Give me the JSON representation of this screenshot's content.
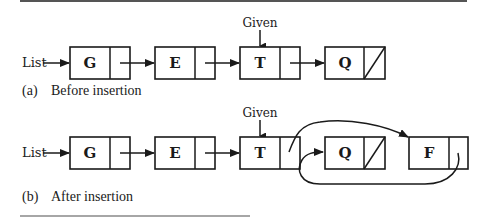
{
  "diagram": {
    "head_label": "List",
    "given_label": "Given",
    "panel_a": {
      "caption_tag": "(a)",
      "caption": "Before insertion",
      "nodes": [
        {
          "value": "G",
          "next": "E"
        },
        {
          "value": "E",
          "next": "T"
        },
        {
          "value": "T",
          "next": "Q",
          "given": true
        },
        {
          "value": "Q",
          "next": null
        }
      ]
    },
    "panel_b": {
      "caption_tag": "(b)",
      "caption": "After insertion",
      "nodes": [
        {
          "value": "G",
          "next": "E"
        },
        {
          "value": "E",
          "next": "T"
        },
        {
          "value": "T",
          "next": "F",
          "given": true
        },
        {
          "value": "Q",
          "next": null
        },
        {
          "value": "F",
          "next": "Q"
        }
      ]
    }
  }
}
